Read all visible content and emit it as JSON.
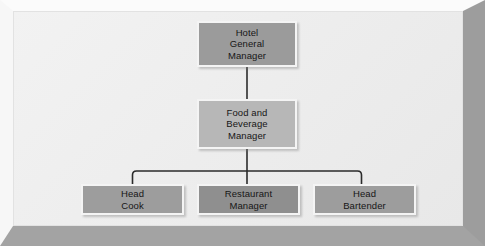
{
  "diagram": {
    "type": "org-chart",
    "frame_style": "beveled-picture-frame",
    "colors": {
      "background": "#eeeeee",
      "frame_light": "#fbfbfb",
      "frame_dark": "#a3a3a3",
      "box_top": "#9b9b9b",
      "box_mid": "#b7b7b7",
      "box_leaf": "#9d9d9d",
      "box_leaf_center": "#8f8f8f",
      "box_border": "#f4f4f4",
      "connector": "#2b2b2b",
      "text": "#161616"
    },
    "nodes": [
      {
        "id": "hotel-general-manager",
        "label": "Hotel\nGeneral\nManager",
        "level": 0
      },
      {
        "id": "food-and-beverage-manager",
        "label": "Food and\nBeverage\nManager",
        "level": 1
      },
      {
        "id": "head-cook",
        "label": "Head\nCook",
        "level": 2
      },
      {
        "id": "restaurant-manager",
        "label": "Restaurant\nManager",
        "level": 2
      },
      {
        "id": "head-bartender",
        "label": "Head\nBartender",
        "level": 2
      }
    ],
    "edges": [
      {
        "from": "hotel-general-manager",
        "to": "food-and-beverage-manager"
      },
      {
        "from": "food-and-beverage-manager",
        "to": "head-cook"
      },
      {
        "from": "food-and-beverage-manager",
        "to": "restaurant-manager"
      },
      {
        "from": "food-and-beverage-manager",
        "to": "head-bartender"
      }
    ]
  }
}
